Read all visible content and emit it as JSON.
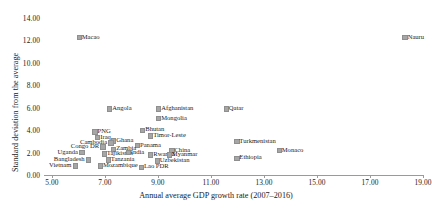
{
  "chart_data": {
    "type": "scatter",
    "title": "",
    "xlabel": "Annual average GDP growth rate (2007–2016)",
    "ylabel": "Standard deviation from the average",
    "xlim": [
      4.0,
      19.6
    ],
    "ylim": [
      0.0,
      14.4
    ],
    "xticks": [
      "5.00",
      "7.00",
      "9.00",
      "11.00",
      "13.00",
      "15.00",
      "17.00",
      "19.00"
    ],
    "xtick_values": [
      5.0,
      7.0,
      9.0,
      11.0,
      13.0,
      15.0,
      17.0,
      19.0
    ],
    "yticks": [
      "0.00",
      "2.00",
      "4.00",
      "6.00",
      "8.00",
      "10.00",
      "12.00",
      "14.00"
    ],
    "ytick_values": [
      0.0,
      2.0,
      4.0,
      6.0,
      8.0,
      10.0,
      12.0,
      14.0
    ],
    "grid": false,
    "legend": "none",
    "marker_color": "#a6a6a6",
    "marker_shape": "square",
    "points": [
      {
        "label": "Macao",
        "x": 6.0,
        "y": 12.3,
        "pos": "right"
      },
      {
        "label": "Nauru",
        "x": 18.3,
        "y": 12.3,
        "pos": "right"
      },
      {
        "label": "Angola",
        "x": 7.15,
        "y": 5.95,
        "pos": "right"
      },
      {
        "label": "Afghanistan",
        "x": 9.0,
        "y": 5.95,
        "pos": "right"
      },
      {
        "label": "Qatar",
        "x": 11.55,
        "y": 5.95,
        "pos": "right"
      },
      {
        "label": "Mongolia",
        "x": 9.0,
        "y": 5.1,
        "pos": "right"
      },
      {
        "label": "Bhutan",
        "x": 8.4,
        "y": 4.05,
        "pos": "right"
      },
      {
        "label": "Timor-Leste",
        "x": 8.7,
        "y": 3.55,
        "pos": "right"
      },
      {
        "label": "PNG",
        "x": 6.6,
        "y": 3.9,
        "pos": "right"
      },
      {
        "label": "Iraq",
        "x": 6.7,
        "y": 3.4,
        "pos": "right"
      },
      {
        "label": "Ghana",
        "x": 7.3,
        "y": 3.1,
        "pos": "right"
      },
      {
        "label": "Cambodia",
        "x": 7.2,
        "y": 2.9,
        "pos": "left"
      },
      {
        "label": "Panama",
        "x": 8.2,
        "y": 2.7,
        "pos": "right"
      },
      {
        "label": "Congo DR",
        "x": 6.9,
        "y": 2.55,
        "pos": "left"
      },
      {
        "label": "Zambia",
        "x": 7.3,
        "y": 2.35,
        "pos": "right"
      },
      {
        "label": "Turkmenistan",
        "x": 11.95,
        "y": 3.05,
        "pos": "right"
      },
      {
        "label": "Monaco",
        "x": 13.55,
        "y": 2.25,
        "pos": "right"
      },
      {
        "label": "Uganda",
        "x": 6.1,
        "y": 2.05,
        "pos": "left"
      },
      {
        "label": "Tajikistan",
        "x": 6.95,
        "y": 1.95,
        "pos": "right"
      },
      {
        "label": "India",
        "x": 7.85,
        "y": 2.05,
        "pos": "right"
      },
      {
        "label": "China",
        "x": 9.5,
        "y": 2.25,
        "pos": "right"
      },
      {
        "label": "Rwanda",
        "x": 8.7,
        "y": 1.85,
        "pos": "right"
      },
      {
        "label": "Myanmar",
        "x": 9.4,
        "y": 1.85,
        "pos": "right"
      },
      {
        "label": "Ethiopia",
        "x": 11.95,
        "y": 1.55,
        "pos": "right"
      },
      {
        "label": "Bangladesh",
        "x": 6.35,
        "y": 1.4,
        "pos": "left"
      },
      {
        "label": "Tanzania",
        "x": 7.1,
        "y": 1.4,
        "pos": "right"
      },
      {
        "label": "Uzbekistan",
        "x": 8.95,
        "y": 1.3,
        "pos": "right"
      },
      {
        "label": "Vietnam",
        "x": 5.85,
        "y": 0.85,
        "pos": "left"
      },
      {
        "label": "Mozambique",
        "x": 6.8,
        "y": 0.85,
        "pos": "right"
      },
      {
        "label": "Lao PDR",
        "x": 8.35,
        "y": 0.75,
        "pos": "right"
      }
    ]
  }
}
